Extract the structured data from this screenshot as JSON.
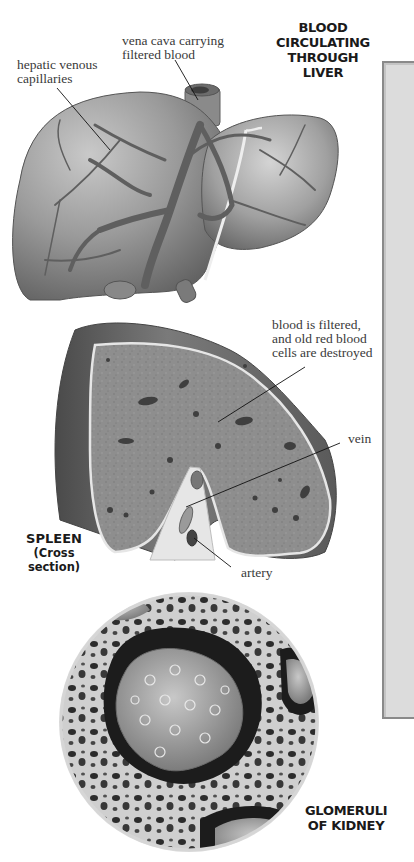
{
  "figure": {
    "sections": [
      {
        "id": "liver",
        "title_lines": [
          "BLOOD",
          "CIRCULATING",
          "THROUGH",
          "LIVER"
        ],
        "callouts": [
          {
            "lines": [
              "vena cava carrying",
              "filtered blood"
            ]
          },
          {
            "lines": [
              "hepatic venous",
              "capillaries"
            ]
          }
        ]
      },
      {
        "id": "spleen",
        "title_lines": [
          "SPLEEN"
        ],
        "subtitle": "(Cross section)",
        "callouts": [
          {
            "lines": [
              "blood is filtered,",
              "and old red blood",
              "cells are destroyed"
            ]
          },
          {
            "lines": [
              "vein"
            ]
          },
          {
            "lines": [
              "artery"
            ]
          }
        ]
      },
      {
        "id": "kidney",
        "title_lines": [
          "GLOMERULI",
          "OF KIDNEY"
        ]
      }
    ],
    "colors": {
      "organ_gray": "#8f8f8f",
      "organ_dark": "#5a5a5a",
      "panel_gray": "#dcdcdc",
      "panel_border": "#8a8a8a",
      "text_dark": "#1a1a1a",
      "text_serif": "#3a3a3a"
    }
  }
}
